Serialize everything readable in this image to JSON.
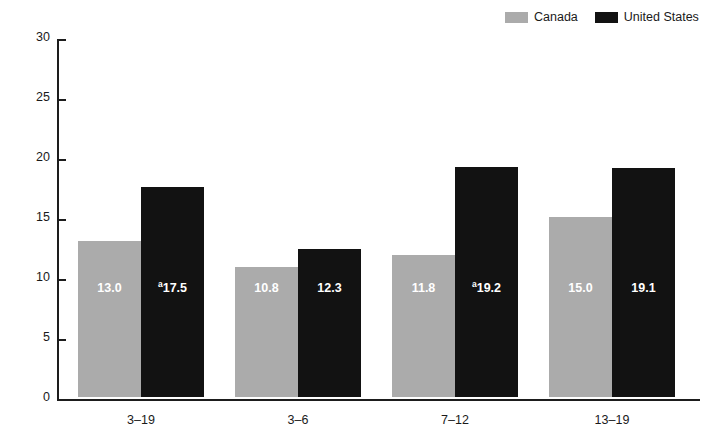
{
  "chart_data": {
    "type": "bar",
    "title": "",
    "subtitle": "",
    "xlabel": "Age group (years)",
    "ylabel": "Percent",
    "categories": [
      "3–19",
      "3–6",
      "7–12",
      "13–19"
    ],
    "series": [
      {
        "name": "Canada",
        "color": "#ababab",
        "values": [
          13.0,
          10.8,
          11.8,
          15.0
        ],
        "labels": [
          "13.0",
          "10.8",
          "11.8",
          "15.0"
        ],
        "footnote_marks": [
          "",
          "",
          "",
          ""
        ]
      },
      {
        "name": "United States",
        "color": "#121212",
        "values": [
          17.5,
          12.3,
          19.2,
          19.1
        ],
        "labels": [
          "17.5",
          "12.3",
          "19.2",
          "19.1"
        ],
        "footnote_marks": [
          "a",
          "",
          "a",
          ""
        ]
      }
    ],
    "ylim": [
      0,
      30
    ],
    "yticks": [
      0,
      5,
      10,
      15,
      20,
      25,
      30
    ],
    "ytick_labels": [
      "0",
      "5",
      "10",
      "15",
      "20",
      "25",
      "30"
    ],
    "grid": false,
    "legend_position": "top-right",
    "legend_entries": [
      "Canada",
      "United States"
    ]
  },
  "axis": {
    "y_title": "Percent",
    "x_title": "Age group (years)",
    "ticks": [
      "30",
      "25",
      "20",
      "15",
      "10",
      "5",
      "0"
    ]
  },
  "legend": {
    "items": [
      {
        "label": "Canada",
        "swatch": "legend-swatch-canada"
      },
      {
        "label": "United States",
        "swatch": "legend-swatch-united-states"
      }
    ]
  }
}
